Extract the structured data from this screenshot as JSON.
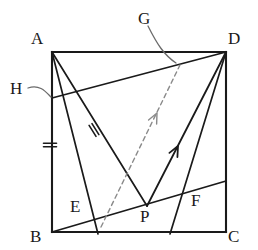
{
  "figure": {
    "kind": "geometry-diagram",
    "width": 258,
    "height": 250,
    "stroke_color": "#1a1a1a",
    "dashed_color": "#8a8a8a",
    "leader_color": "#6b6b6b",
    "background": "#ffffff"
  },
  "labels": [
    {
      "name": "vertex-label-A",
      "text": "A",
      "x": 31,
      "y": 30
    },
    {
      "name": "vertex-label-D",
      "text": "D",
      "x": 228,
      "y": 30
    },
    {
      "name": "vertex-label-B",
      "text": "B",
      "x": 30,
      "y": 228
    },
    {
      "name": "vertex-label-C",
      "text": "C",
      "x": 228,
      "y": 228
    },
    {
      "name": "point-label-G",
      "text": "G",
      "x": 138,
      "y": 10
    },
    {
      "name": "point-label-H",
      "text": "H",
      "x": 10,
      "y": 80
    },
    {
      "name": "point-label-E",
      "text": "E",
      "x": 70,
      "y": 198
    },
    {
      "name": "point-label-P",
      "text": "P",
      "x": 140,
      "y": 208
    },
    {
      "name": "point-label-F",
      "text": "F",
      "x": 191,
      "y": 192
    }
  ],
  "vertices": {
    "A": {
      "x": 52,
      "y": 52
    },
    "D": {
      "x": 226,
      "y": 52
    },
    "C": {
      "x": 226,
      "y": 232
    },
    "B": {
      "x": 52,
      "y": 232
    },
    "G": {
      "x": 180,
      "y": 65
    },
    "H": {
      "x": 52,
      "y": 98
    },
    "E": {
      "x": 101,
      "y": 227
    },
    "P": {
      "x": 147,
      "y": 206
    },
    "F": {
      "x": 195,
      "y": 190
    }
  },
  "square_sides": [
    {
      "name": "side-AD",
      "from": "A",
      "to": "D"
    },
    {
      "name": "side-DC",
      "from": "D",
      "to": "C"
    },
    {
      "name": "side-CB",
      "from": "C",
      "to": "B"
    },
    {
      "name": "side-BA",
      "from": "B",
      "to": "A"
    }
  ],
  "segments": [
    {
      "name": "segment-H-D",
      "x1": 52,
      "y1": 98,
      "x2": 226,
      "y2": 52
    },
    {
      "name": "segment-A-P",
      "x1": 52,
      "y1": 52,
      "x2": 147,
      "y2": 206
    },
    {
      "name": "segment-A-bottom",
      "x1": 52,
      "y1": 52,
      "x2": 98,
      "y2": 234
    },
    {
      "name": "segment-B-throughE-P-F-right",
      "x1": 52,
      "y1": 232,
      "x2": 226,
      "y2": 181
    },
    {
      "name": "segment-D-bottom",
      "x1": 226,
      "y1": 52,
      "x2": 170,
      "y2": 234
    },
    {
      "name": "segment-A-D-diagonalish",
      "x1": 52,
      "y1": 52,
      "x2": 226,
      "y2": 52
    }
  ],
  "rays": [
    {
      "name": "ray-E-to-G-dashed",
      "x1": 101,
      "y1": 227,
      "x2": 180,
      "y2": 65,
      "style": "dashed",
      "arrow_at": {
        "x": 157,
        "y": 113
      }
    },
    {
      "name": "ray-P-to-D-solid",
      "x1": 147,
      "y1": 206,
      "x2": 226,
      "y2": 52,
      "style": "solid",
      "arrow_at": {
        "x": 178,
        "y": 146
      }
    }
  ],
  "tick_marks": [
    {
      "name": "tick-double-on-AB",
      "x": 50,
      "y": 145,
      "angle": 0,
      "count": 2
    },
    {
      "name": "tick-double-on-AP",
      "x": 94,
      "y": 130,
      "angle": 58,
      "count": 2
    }
  ],
  "leaders": [
    {
      "name": "leader-line-G",
      "path": "M 148,26 C 157,44 164,55 176,63"
    },
    {
      "name": "leader-line-H",
      "path": "M 28,88 C 40,84 46,92 51,97"
    }
  ]
}
